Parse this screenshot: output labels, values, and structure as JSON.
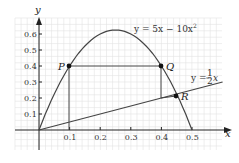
{
  "figure": {
    "axis_labels": {
      "x": "x",
      "y": "y"
    },
    "x_ticks": [
      "0.1",
      "0.2",
      "0.3",
      "0.4",
      "0.5"
    ],
    "y_ticks": [
      "0.1",
      "0.2",
      "0.3",
      "0.4",
      "0.5",
      "0.6"
    ],
    "curve_label": "y = 5x − 10x",
    "curve_label_sup": "2",
    "line_label_prefix": "y = ",
    "line_label_num": "1",
    "line_label_den": "2",
    "line_label_suffix": "x",
    "points": {
      "P": "P",
      "Q": "Q",
      "R": "R"
    }
  },
  "chart_data": {
    "type": "line",
    "title": "",
    "xlabel": "x",
    "ylabel": "y",
    "xlim": [
      -0.08,
      0.6
    ],
    "ylim": [
      -0.1,
      0.7
    ],
    "grid": true,
    "series": [
      {
        "name": "y = 5x − 10x^2",
        "x": [
          0,
          0.05,
          0.1,
          0.15,
          0.2,
          0.25,
          0.3,
          0.35,
          0.4,
          0.45,
          0.5
        ],
        "values": [
          0,
          0.225,
          0.4,
          0.525,
          0.6,
          0.625,
          0.6,
          0.525,
          0.4,
          0.225,
          0
        ]
      },
      {
        "name": "y = 1/2 x",
        "x": [
          0,
          0.6
        ],
        "values": [
          0,
          0.3
        ]
      }
    ],
    "annotations": [
      {
        "label": "P",
        "x": 0.1,
        "y": 0.4
      },
      {
        "label": "Q",
        "x": 0.4,
        "y": 0.4
      },
      {
        "label": "R",
        "x": 0.45,
        "y": 0.225
      }
    ]
  }
}
